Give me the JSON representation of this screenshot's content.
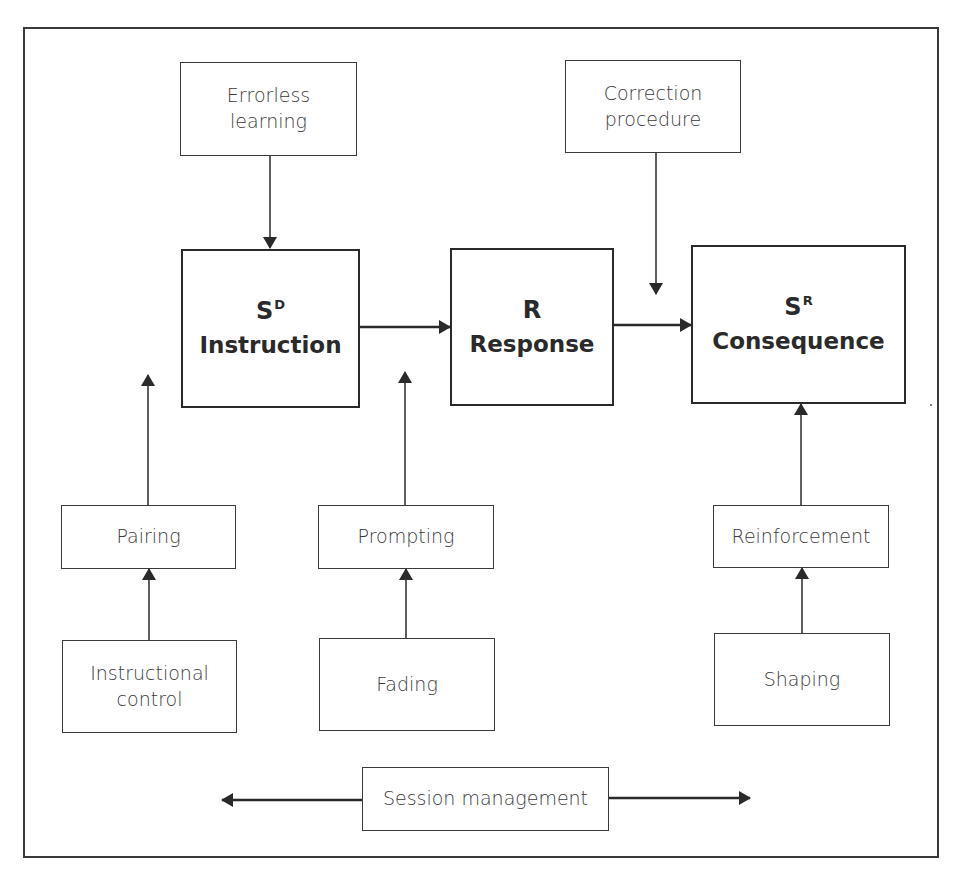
{
  "diagram": {
    "type": "flowchart",
    "main_chain": [
      {
        "id": "sd",
        "symbol": "S",
        "superscript": "D",
        "label": "Instruction"
      },
      {
        "id": "r",
        "symbol": "R",
        "superscript": "",
        "label": "Response"
      },
      {
        "id": "sr",
        "symbol": "S",
        "superscript": "R",
        "label": "Consequence"
      }
    ],
    "modifiers": {
      "errorless_learning": {
        "line1": "Errorless",
        "line2": "learning"
      },
      "correction_procedure": {
        "line1": "Correction",
        "line2": "procedure"
      },
      "pairing": {
        "label": "Pairing"
      },
      "instructional_control": {
        "line1": "Instructional",
        "line2": "control"
      },
      "prompting": {
        "label": "Prompting"
      },
      "fading": {
        "label": "Fading"
      },
      "reinforcement": {
        "label": "Reinforcement"
      },
      "shaping": {
        "label": "Shaping"
      },
      "session_management": {
        "label": "Session management"
      }
    },
    "edges": [
      {
        "from": "Errorless learning",
        "to": "Instruction"
      },
      {
        "from": "Instruction",
        "to": "Response"
      },
      {
        "from": "Response",
        "to": "Consequence"
      },
      {
        "from": "Correction procedure",
        "to": "Response→Consequence link"
      },
      {
        "from": "Pairing",
        "to": "Instruction (gap)"
      },
      {
        "from": "Instructional control",
        "to": "Pairing"
      },
      {
        "from": "Prompting",
        "to": "Instruction→Response link (gap)"
      },
      {
        "from": "Fading",
        "to": "Prompting"
      },
      {
        "from": "Reinforcement",
        "to": "Consequence"
      },
      {
        "from": "Shaping",
        "to": "Reinforcement"
      },
      {
        "from": "Session management",
        "to": "left and right (bidirectional)"
      }
    ],
    "colors": {
      "stroke": "#2a2a2a",
      "text": "#3a3a3a",
      "background": "#ffffff"
    }
  }
}
